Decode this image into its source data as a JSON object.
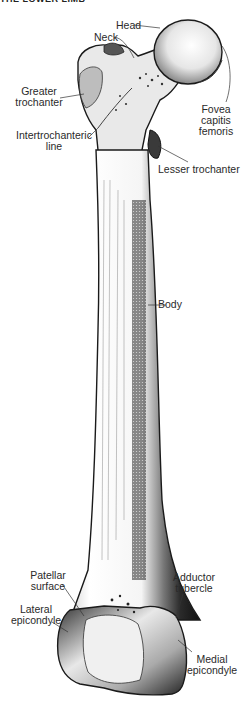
{
  "header": {
    "title": "THE LOWER LIMB"
  },
  "figure": {
    "labels": {
      "head": "Head",
      "neck": "Neck",
      "greater_trochanter_1": "Greater",
      "greater_trochanter_2": "trochanter",
      "fovea_1": "Fovea",
      "fovea_2": "capitis",
      "fovea_3": "femoris",
      "intertrochanteric_1": "Intertrochanteric",
      "intertrochanteric_2": "line",
      "lesser_trochanter": "Lesser trochanter",
      "body": "Body",
      "patellar_1": "Patellar",
      "patellar_2": "surface",
      "lateral_epicondyle_1": "Lateral",
      "lateral_epicondyle_2": "epicondyle",
      "adductor_1": "Adductor",
      "adductor_2": "tubercle",
      "medial_epicondyle_1": "Medial",
      "medial_epicondyle_2": "epicondyle"
    },
    "colors": {
      "ink": "#1a1a1a",
      "shade": "#555555",
      "light": "#f2f2f2",
      "background": "#ffffff"
    }
  }
}
